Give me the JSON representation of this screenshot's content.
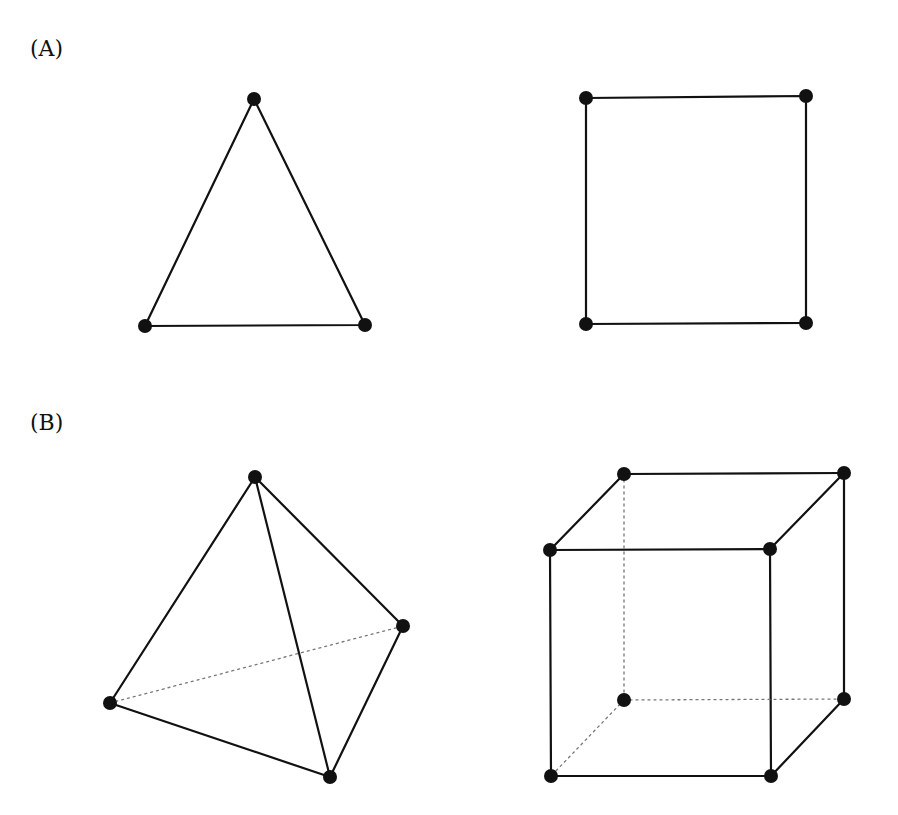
{
  "panels": [
    {
      "label": "(A)",
      "description": "2D: triangle and square"
    },
    {
      "label": "(B)",
      "description": "3D: tetrahedron and cube"
    }
  ],
  "colors": {
    "stroke": "#111111",
    "vertex": "#111111",
    "hidden_edge": "#888888"
  },
  "figures": {
    "triangle": {
      "vertices": [
        [
          254,
          99
        ],
        [
          145,
          326
        ],
        [
          365,
          325
        ]
      ]
    },
    "square": {
      "vertices": [
        [
          586,
          98
        ],
        [
          806,
          96
        ],
        [
          806,
          323
        ],
        [
          586,
          324
        ]
      ]
    },
    "tetrahedron": {
      "vertices": [
        [
          255,
          477
        ],
        [
          110,
          703
        ],
        [
          403,
          626
        ],
        [
          330,
          777
        ]
      ],
      "hidden_edges": [
        [
          1,
          2
        ]
      ]
    },
    "cube": {
      "vertices": [
        [
          624,
          474
        ],
        [
          844,
          473
        ],
        [
          550,
          550
        ],
        [
          770,
          549
        ],
        [
          624,
          700
        ],
        [
          844,
          699
        ],
        [
          551,
          776
        ],
        [
          771,
          776
        ]
      ],
      "hidden_edges": [
        [
          0,
          4
        ],
        [
          4,
          5
        ],
        [
          4,
          6
        ]
      ]
    }
  }
}
